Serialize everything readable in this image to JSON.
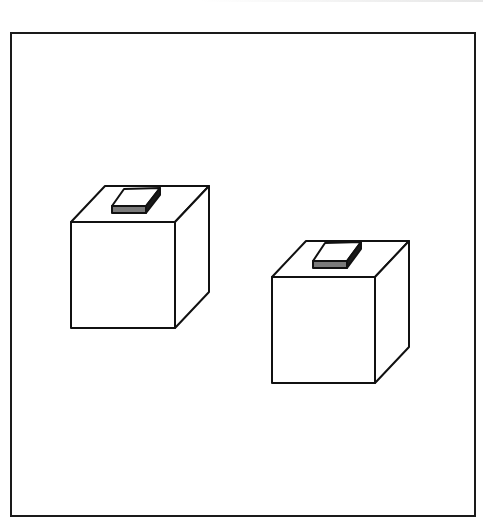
{
  "figure": {
    "frame": {
      "x": 11,
      "y": 33,
      "width": 464,
      "height": 483,
      "stroke": "#1a1a1a"
    },
    "colors": {
      "line": "#111111",
      "fill": "#ffffff",
      "knob_front": "#7a7a7a",
      "knob_side": "#1a1a1a"
    },
    "objects": [
      {
        "id": "cube-left",
        "front": {
          "x1": 71,
          "y1": 222,
          "x2": 175,
          "y2": 328
        },
        "depth_offset": {
          "dx": 34,
          "dy": -36
        },
        "knob": {
          "top": "112,206 124,189 160,188 146,206",
          "front": "112,206 146,206 146,213 112,213",
          "side": "146,206 160,188 160,195 146,213"
        }
      },
      {
        "id": "cube-right",
        "front": {
          "x1": 272,
          "y1": 277,
          "x2": 375,
          "y2": 383
        },
        "depth_offset": {
          "dx": 34,
          "dy": -36
        },
        "knob": {
          "top": "313,261 325,243 361,242 347,261",
          "front": "313,261 347,261 347,268 313,268",
          "side": "347,261 361,242 361,249 347,268"
        }
      }
    ]
  }
}
